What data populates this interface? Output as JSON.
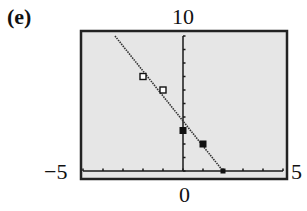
{
  "panel": {
    "label": "(e)"
  },
  "window": {
    "ymax_label": "10",
    "xmin_label": "−5",
    "xmax_label": "5",
    "xzero_label": "0"
  },
  "colors": {
    "background": "#e6e6e6",
    "frame": "#222222",
    "axis": "#1a1a1a",
    "line": "#333333",
    "marker": "#111111"
  },
  "chart_data": {
    "type": "scatter",
    "title": "(e)",
    "xlabel": "",
    "ylabel": "",
    "xlim": [
      -5,
      5
    ],
    "ylim": [
      0,
      10
    ],
    "x_tick_step": 1,
    "y_tick_step": 1,
    "grid": false,
    "tick_labels": {
      "xmin": "-5",
      "xmax": "5",
      "x0": "0",
      "ymax": "10"
    },
    "series": [
      {
        "name": "line",
        "style": "dotted-line",
        "x": [
          -3.4,
          2
        ],
        "y": [
          10,
          0
        ],
        "equation_approx": "y = -2x + 4"
      },
      {
        "name": "open-squares",
        "style": "open-square",
        "x": [
          -2,
          -1
        ],
        "y": [
          7,
          6
        ]
      },
      {
        "name": "filled-squares",
        "style": "filled-square",
        "x": [
          0,
          1,
          2
        ],
        "y": [
          3,
          2,
          0
        ]
      }
    ]
  }
}
